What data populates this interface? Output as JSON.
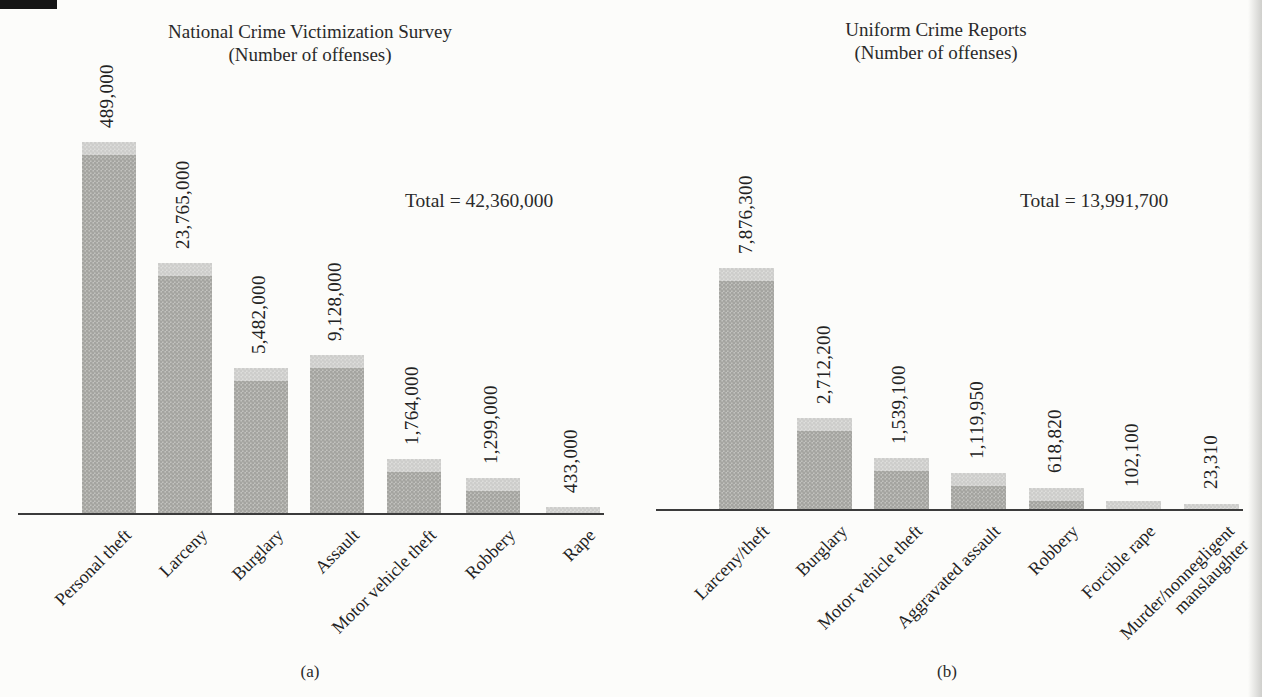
{
  "colors": {
    "background": "#fcfcfa",
    "bar_fill": "#c2c2be",
    "bar_halftone_dot": "#a4a4a0",
    "bar_top_cap": "rgba(255,255,255,0.45)",
    "axis": "#3b3b3b",
    "text": "#222222"
  },
  "chart_data": [
    {
      "id": "a",
      "type": "bar",
      "title": "National Crime Victimization Survey",
      "subtitle": "(Number of offenses)",
      "total_annotation": "Total = 42,360,000",
      "total_value": 42360000,
      "caption": "(a)",
      "categories": [
        "Personal theft",
        "Larceny",
        "Burglary",
        "Assault",
        "Motor vehicle theft",
        "Robbery",
        "Rape"
      ],
      "values": [
        489000,
        23765000,
        5482000,
        9128000,
        1764000,
        1299000,
        433000
      ],
      "value_labels": [
        "489,000",
        "23,765,000",
        "5,482,000",
        "9,128,000",
        "1,764,000",
        "1,299,000",
        "433,000"
      ],
      "grid": false,
      "legend": false,
      "value_label_rotation_deg": 90,
      "category_label_rotation_deg": 45,
      "bar_heights_px": [
        371,
        250,
        145,
        158,
        54,
        35,
        6
      ]
    },
    {
      "id": "b",
      "type": "bar",
      "title": "Uniform Crime Reports",
      "subtitle": "(Number of offenses)",
      "total_annotation": "Total = 13,991,700",
      "total_value": 13991700,
      "caption": "(b)",
      "categories": [
        "Larceny/theft",
        "Burglary",
        "Motor vehicle theft",
        "Aggravated assault",
        "Robbery",
        "Forcible rape",
        "Murder/nonnegligent\nmanslaughter"
      ],
      "values": [
        7876300,
        2712200,
        1539100,
        1119950,
        618820,
        102100,
        23310
      ],
      "value_labels": [
        "7,876,300",
        "2,712,200",
        "1,539,100",
        "1,119,950",
        "618,820",
        "102,100",
        "23,310"
      ],
      "grid": false,
      "legend": false,
      "value_label_rotation_deg": 90,
      "category_label_rotation_deg": 45,
      "bar_heights_px": [
        241,
        91,
        51,
        36,
        21,
        8,
        5
      ]
    }
  ]
}
